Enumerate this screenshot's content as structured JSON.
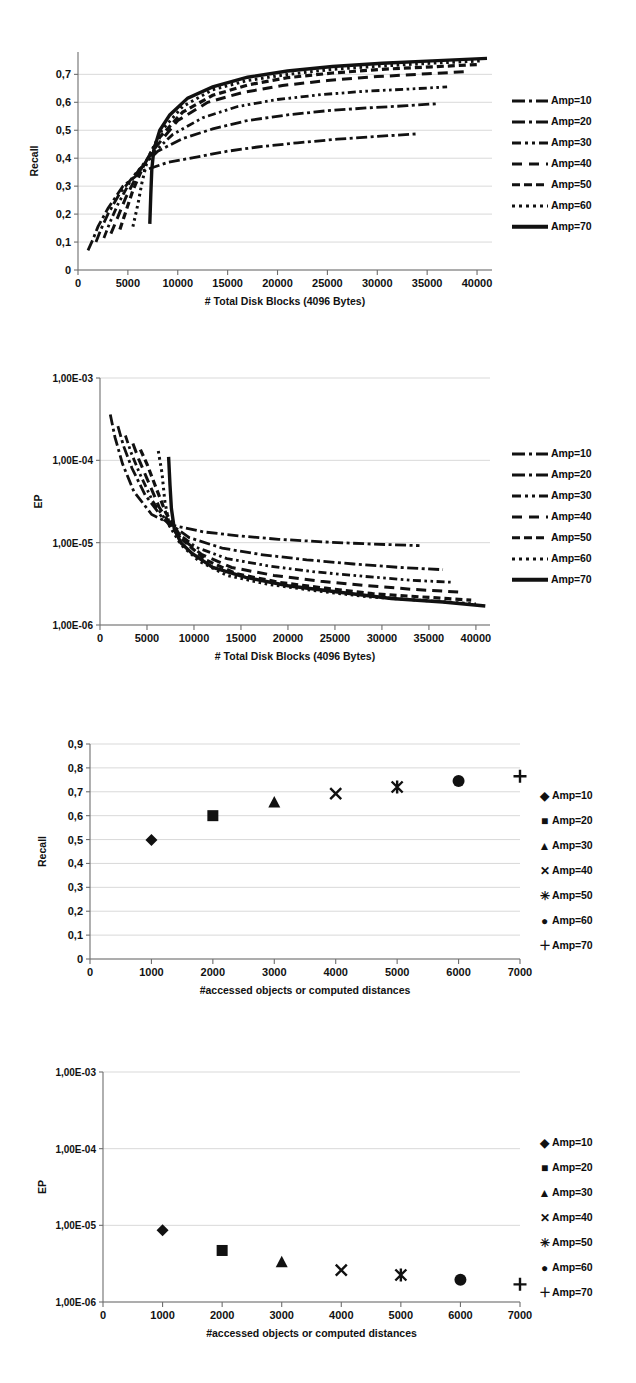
{
  "page": {
    "background_color": "#ffffff",
    "ink_color": "#111111",
    "grid_color": "#c8c8c8"
  },
  "figures": [
    {
      "id": "recall-blocks",
      "axis": {
        "ylabel": "Recall",
        "xlabel": "# Total Disk Blocks (4096 Bytes)",
        "yticks": [
          "0",
          "0,1",
          "0,2",
          "0,3",
          "0,4",
          "0,5",
          "0,6",
          "0,7"
        ],
        "xticks": [
          "0",
          "5000",
          "10000",
          "15000",
          "20000",
          "25000",
          "30000",
          "35000",
          "40000"
        ]
      },
      "legend": [
        {
          "label": "Amp=10",
          "style": "dashdot",
          "swatch_class": "sw-dashdot"
        },
        {
          "label": "Amp=20",
          "style": "dashdot",
          "swatch_class": "sw-dashdot"
        },
        {
          "label": "Amp=30",
          "style": "dashdotdot",
          "swatch_class": "sw-dashdotdot"
        },
        {
          "label": "Amp=40",
          "style": "longdash",
          "swatch_class": "sw-longdash"
        },
        {
          "label": "Amp=50",
          "style": "dash",
          "swatch_class": "sw-dash"
        },
        {
          "label": "Amp=60",
          "style": "dot",
          "swatch_class": "sw-dot"
        },
        {
          "label": "Amp=70",
          "style": "solid",
          "swatch_class": "sw-solidthick"
        }
      ]
    },
    {
      "id": "ep-blocks",
      "axis": {
        "ylabel": "EP",
        "xlabel": "# Total Disk Blocks (4096 Bytes)",
        "yticks": [
          "1,00E-03",
          "1,00E-04",
          "1,00E-05",
          "1,00E-06"
        ],
        "xticks": [
          "0",
          "5000",
          "10000",
          "15000",
          "20000",
          "25000",
          "30000",
          "35000",
          "40000"
        ]
      },
      "legend": [
        {
          "label": "Amp=10",
          "style": "dashdot",
          "swatch_class": "sw-dashdot"
        },
        {
          "label": "Amp=20",
          "style": "dashdot",
          "swatch_class": "sw-dashdot"
        },
        {
          "label": "Amp=30",
          "style": "dashdotdot",
          "swatch_class": "sw-dashdotdot"
        },
        {
          "label": "Amp=40",
          "style": "longdash",
          "swatch_class": "sw-longdash"
        },
        {
          "label": "Amp=50",
          "style": "dash",
          "swatch_class": "sw-dash"
        },
        {
          "label": "Amp=60",
          "style": "dot",
          "swatch_class": "sw-dot"
        },
        {
          "label": "Amp=70",
          "style": "solid",
          "swatch_class": "sw-solidthick"
        }
      ]
    },
    {
      "id": "recall-obj",
      "axis": {
        "ylabel": "Recall",
        "xlabel": "#accessed objects or computed distances",
        "yticks": [
          "0",
          "0,1",
          "0,2",
          "0,3",
          "0,4",
          "0,5",
          "0,6",
          "0,7",
          "0,8",
          "0,9"
        ],
        "xticks": [
          "0",
          "1000",
          "2000",
          "3000",
          "4000",
          "5000",
          "6000",
          "7000"
        ]
      },
      "legend": [
        {
          "label": "Amp=10",
          "marker": "diamond",
          "glyph": "◆"
        },
        {
          "label": "Amp=20",
          "marker": "square",
          "glyph": "■"
        },
        {
          "label": "Amp=30",
          "marker": "triangle",
          "glyph": "▲"
        },
        {
          "label": "Amp=40",
          "marker": "x",
          "glyph": "✕"
        },
        {
          "label": "Amp=50",
          "marker": "asterisk",
          "glyph": "✳"
        },
        {
          "label": "Amp=60",
          "marker": "circle",
          "glyph": "●"
        },
        {
          "label": "Amp=70",
          "marker": "plus",
          "glyph": "＋"
        }
      ]
    },
    {
      "id": "ep-obj",
      "axis": {
        "ylabel": "EP",
        "xlabel": "#accessed objects or computed distances",
        "yticks": [
          "1,00E-03",
          "1,00E-04",
          "1,00E-05",
          "1,00E-06"
        ],
        "xticks": [
          "0",
          "1000",
          "2000",
          "3000",
          "4000",
          "5000",
          "6000",
          "7000"
        ]
      },
      "legend": [
        {
          "label": "Amp=10",
          "marker": "diamond",
          "glyph": "◆"
        },
        {
          "label": "Amp=20",
          "marker": "square",
          "glyph": "■"
        },
        {
          "label": "Amp=30",
          "marker": "triangle",
          "glyph": "▲"
        },
        {
          "label": "Amp=40",
          "marker": "x",
          "glyph": "✕"
        },
        {
          "label": "Amp=50",
          "marker": "asterisk",
          "glyph": "✳"
        },
        {
          "label": "Amp=60",
          "marker": "circle",
          "glyph": "●"
        },
        {
          "label": "Amp=70",
          "marker": "plus",
          "glyph": "＋"
        }
      ]
    }
  ],
  "chart_data": [
    {
      "type": "line",
      "id": "recall-blocks",
      "title": "",
      "xlabel": "# Total Disk Blocks (4096 Bytes)",
      "ylabel": "Recall",
      "xlim": [
        0,
        41500
      ],
      "ylim": [
        0,
        0.78
      ],
      "yscale": "linear",
      "grid": true,
      "legend_position": "right",
      "xticks": [
        0,
        5000,
        10000,
        15000,
        20000,
        25000,
        30000,
        35000,
        40000
      ],
      "yticks": [
        0,
        0.1,
        0.2,
        0.3,
        0.4,
        0.5,
        0.6,
        0.7
      ],
      "series": [
        {
          "name": "Amp=10",
          "style": "dashdot",
          "x": [
            1000,
            1500,
            2000,
            3000,
            4500,
            6500,
            9000,
            12000,
            15000,
            18000,
            22000,
            26000,
            30000,
            34000
          ],
          "y": [
            0.07,
            0.11,
            0.155,
            0.22,
            0.3,
            0.355,
            0.385,
            0.405,
            0.425,
            0.44,
            0.455,
            0.468,
            0.478,
            0.487
          ]
        },
        {
          "name": "Amp=20",
          "style": "dashdot",
          "x": [
            1800,
            2300,
            3000,
            4200,
            6000,
            8000,
            10500,
            13500,
            17000,
            21000,
            25000,
            29000,
            33000,
            36000
          ],
          "y": [
            0.1,
            0.145,
            0.2,
            0.275,
            0.355,
            0.425,
            0.47,
            0.505,
            0.535,
            0.555,
            0.57,
            0.58,
            0.588,
            0.595
          ]
        },
        {
          "name": "Amp=30",
          "style": "dashdotdot",
          "x": [
            2600,
            3200,
            4000,
            5200,
            7000,
            9500,
            12500,
            16000,
            20000,
            24500,
            29000,
            33500,
            37000
          ],
          "y": [
            0.115,
            0.17,
            0.235,
            0.315,
            0.4,
            0.485,
            0.545,
            0.585,
            0.61,
            0.628,
            0.64,
            0.648,
            0.655
          ]
        },
        {
          "name": "Amp=40",
          "style": "longdash",
          "x": [
            3300,
            4000,
            4800,
            6000,
            7800,
            10000,
            13000,
            16500,
            20500,
            25000,
            30000,
            35000,
            39000
          ],
          "y": [
            0.13,
            0.19,
            0.26,
            0.345,
            0.44,
            0.535,
            0.6,
            0.635,
            0.66,
            0.678,
            0.692,
            0.702,
            0.71
          ]
        },
        {
          "name": "Amp=50",
          "style": "dash",
          "x": [
            4200,
            4800,
            5500,
            6600,
            8200,
            10500,
            13500,
            17000,
            21000,
            25500,
            30500,
            35500,
            40000
          ],
          "y": [
            0.145,
            0.21,
            0.285,
            0.375,
            0.475,
            0.565,
            0.625,
            0.662,
            0.688,
            0.705,
            0.718,
            0.727,
            0.735
          ]
        },
        {
          "name": "Amp=60",
          "style": "dot",
          "x": [
            5500,
            6000,
            6400,
            7000,
            8400,
            10500,
            13500,
            17000,
            21000,
            25500,
            30500,
            35500,
            40500
          ],
          "y": [
            0.155,
            0.235,
            0.31,
            0.4,
            0.5,
            0.585,
            0.645,
            0.678,
            0.7,
            0.718,
            0.73,
            0.74,
            0.748
          ]
        },
        {
          "name": "Amp=70",
          "style": "solid",
          "x": [
            7200,
            7300,
            7400,
            7600,
            8200,
            9200,
            11000,
            13500,
            17000,
            21000,
            25500,
            30500,
            35500,
            41000
          ],
          "y": [
            0.165,
            0.27,
            0.36,
            0.43,
            0.5,
            0.555,
            0.615,
            0.655,
            0.69,
            0.712,
            0.728,
            0.74,
            0.748,
            0.757
          ]
        }
      ]
    },
    {
      "type": "line",
      "id": "ep-blocks",
      "title": "",
      "xlabel": "# Total Disk Blocks (4096 Bytes)",
      "ylabel": "EP",
      "xlim": [
        0,
        41500
      ],
      "ylim": [
        1e-06,
        0.001
      ],
      "yscale": "log",
      "grid": true,
      "legend_position": "right",
      "xticks": [
        0,
        5000,
        10000,
        15000,
        20000,
        25000,
        30000,
        35000,
        40000
      ],
      "yticks": [
        0.001,
        0.0001,
        1e-05,
        1e-06
      ],
      "series": [
        {
          "name": "Amp=10",
          "style": "dashdot",
          "x": [
            1100,
            1600,
            2400,
            3600,
            5500,
            8000,
            11000,
            15000,
            19000,
            24000,
            29000,
            34000
          ],
          "y": [
            0.00036,
            0.00019,
            9e-05,
            4.2e-05,
            2.2e-05,
            1.6e-05,
            1.35e-05,
            1.2e-05,
            1.1e-05,
            1.02e-05,
            9.6e-06,
            9.2e-06
          ]
        },
        {
          "name": "Amp=20",
          "style": "dashdot",
          "x": [
            1900,
            2500,
            3400,
            4800,
            6800,
            9500,
            13000,
            17000,
            22000,
            27000,
            32000,
            36500
          ],
          "y": [
            0.00026,
            0.00015,
            8e-05,
            3.8e-05,
            1.9e-05,
            1.15e-05,
            8.6e-06,
            7.2e-06,
            6.2e-06,
            5.5e-06,
            5e-06,
            4.7e-06
          ]
        },
        {
          "name": "Amp=30",
          "style": "dashdotdot",
          "x": [
            2700,
            3300,
            4200,
            5600,
            7600,
            10200,
            13500,
            18000,
            23000,
            28000,
            33000,
            37500
          ],
          "y": [
            0.0002,
            0.000125,
            7e-05,
            3.2e-05,
            1.5e-05,
            8.8e-06,
            6.4e-06,
            5.2e-06,
            4.4e-06,
            3.9e-06,
            3.5e-06,
            3.3e-06
          ]
        },
        {
          "name": "Amp=40",
          "style": "longdash",
          "x": [
            3500,
            4100,
            5000,
            6300,
            8200,
            10800,
            14000,
            18500,
            23500,
            28500,
            33500,
            38500
          ],
          "y": [
            0.00016,
            0.000105,
            6e-05,
            2.7e-05,
            1.25e-05,
            7.2e-06,
            5e-06,
            4e-06,
            3.4e-06,
            3e-06,
            2.7e-06,
            2.5e-06
          ]
        },
        {
          "name": "Amp=50",
          "style": "dash",
          "x": [
            4300,
            5000,
            5800,
            7000,
            8800,
            11200,
            14500,
            19000,
            24000,
            29000,
            34000,
            39500
          ],
          "y": [
            0.000135,
            9e-05,
            5.2e-05,
            2.3e-05,
            1.08e-05,
            6.2e-06,
            4.2e-06,
            3.3e-06,
            2.8e-06,
            2.4e-06,
            2.2e-06,
            2e-06
          ]
        },
        {
          "name": "Amp=60",
          "style": "dot",
          "x": [
            6200,
            6600,
            6900,
            7400,
            8600,
            10500,
            13500,
            18000,
            23000,
            28500,
            34000,
            40000
          ],
          "y": [
            0.00013,
            7e-05,
            3.2e-05,
            1.6e-05,
            9.5e-06,
            6e-06,
            4e-06,
            3.1e-06,
            2.6e-06,
            2.2e-06,
            2e-06,
            1.8e-06
          ]
        },
        {
          "name": "Amp=70",
          "style": "solid",
          "x": [
            7300,
            7450,
            7600,
            7900,
            8600,
            9800,
            12000,
            15500,
            20000,
            25500,
            31000,
            36500,
            41000
          ],
          "y": [
            0.00011,
            5e-05,
            2.6e-05,
            1.5e-05,
            1e-05,
            7.4e-06,
            5e-06,
            3.8e-06,
            3e-06,
            2.5e-06,
            2.1e-06,
            1.9e-06,
            1.7e-06
          ]
        }
      ]
    },
    {
      "type": "scatter",
      "id": "recall-obj",
      "title": "",
      "xlabel": "#accessed objects or computed distances",
      "ylabel": "Recall",
      "xlim": [
        0,
        7000
      ],
      "ylim": [
        0,
        0.9
      ],
      "yscale": "linear",
      "grid": true,
      "legend_position": "right",
      "xticks": [
        0,
        1000,
        2000,
        3000,
        4000,
        5000,
        6000,
        7000
      ],
      "yticks": [
        0,
        0.1,
        0.2,
        0.3,
        0.4,
        0.5,
        0.6,
        0.7,
        0.8,
        0.9
      ],
      "points": [
        {
          "name": "Amp=10",
          "marker": "diamond",
          "x": 1000,
          "y": 0.498
        },
        {
          "name": "Amp=20",
          "marker": "square",
          "x": 2000,
          "y": 0.6
        },
        {
          "name": "Amp=30",
          "marker": "triangle",
          "x": 3000,
          "y": 0.655
        },
        {
          "name": "Amp=40",
          "marker": "x",
          "x": 4000,
          "y": 0.692
        },
        {
          "name": "Amp=50",
          "marker": "asterisk",
          "x": 5000,
          "y": 0.72
        },
        {
          "name": "Amp=60",
          "marker": "circle",
          "x": 6000,
          "y": 0.745
        },
        {
          "name": "Amp=70",
          "marker": "plus",
          "x": 7000,
          "y": 0.765
        }
      ]
    },
    {
      "type": "scatter",
      "id": "ep-obj",
      "title": "",
      "xlabel": "#accessed objects or computed distances",
      "ylabel": "EP",
      "xlim": [
        0,
        7000
      ],
      "ylim": [
        1e-06,
        0.001
      ],
      "yscale": "log",
      "grid": true,
      "legend_position": "right",
      "xticks": [
        0,
        1000,
        2000,
        3000,
        4000,
        5000,
        6000,
        7000
      ],
      "yticks": [
        0.001,
        0.0001,
        1e-05,
        1e-06
      ],
      "points": [
        {
          "name": "Amp=10",
          "marker": "diamond",
          "x": 1000,
          "y": 8.6e-06
        },
        {
          "name": "Amp=20",
          "marker": "square",
          "x": 2000,
          "y": 4.7e-06
        },
        {
          "name": "Amp=30",
          "marker": "triangle",
          "x": 3000,
          "y": 3.3e-06
        },
        {
          "name": "Amp=40",
          "marker": "x",
          "x": 4000,
          "y": 2.6e-06
        },
        {
          "name": "Amp=50",
          "marker": "asterisk",
          "x": 5000,
          "y": 2.25e-06
        },
        {
          "name": "Amp=60",
          "marker": "circle",
          "x": 6000,
          "y": 1.95e-06
        },
        {
          "name": "Amp=70",
          "marker": "plus",
          "x": 7000,
          "y": 1.7e-06
        }
      ]
    }
  ]
}
